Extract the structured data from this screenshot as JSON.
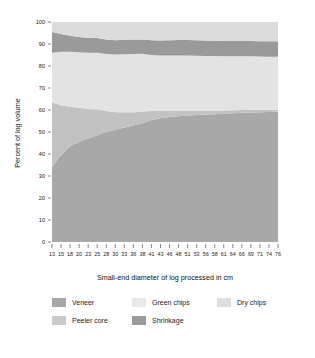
{
  "chart_data": {
    "type": "area",
    "stacked": true,
    "title": "",
    "xlabel": "Small-end diameter of log processed in cm",
    "ylabel": "Percent of log volume",
    "ylim": [
      0,
      100
    ],
    "yticks": [
      0,
      10,
      20,
      30,
      40,
      50,
      60,
      70,
      80,
      90,
      100
    ],
    "grid": false,
    "legend_position": "bottom",
    "categories": [
      13,
      15,
      18,
      20,
      23,
      25,
      28,
      30,
      33,
      36,
      38,
      41,
      43,
      46,
      48,
      51,
      53,
      56,
      58,
      61,
      64,
      66,
      69,
      71,
      74,
      76
    ],
    "series": [
      {
        "name": "Veneer",
        "color": "#a8a8a8",
        "values": [
          34.0,
          39.5,
          43.5,
          45.5,
          47.0,
          48.5,
          50.0,
          51.0,
          52.0,
          53.0,
          54.0,
          55.5,
          56.2,
          56.8,
          57.2,
          57.5,
          57.7,
          57.9,
          58.1,
          58.3,
          58.5,
          58.7,
          58.9,
          59.0,
          59.1,
          59.2
        ]
      },
      {
        "name": "Peeler core",
        "color": "#c2c2c2",
        "values": [
          29.5,
          22.5,
          18.0,
          15.5,
          13.5,
          11.8,
          9.5,
          8.0,
          7.0,
          6.0,
          5.3,
          4.0,
          3.3,
          2.8,
          2.5,
          2.3,
          2.1,
          1.9,
          1.7,
          1.5,
          1.4,
          1.3,
          1.2,
          1.1,
          1.0,
          1.0
        ]
      },
      {
        "name": "Green chips",
        "color": "#e3e3e3",
        "values": [
          22.5,
          24.5,
          25.0,
          25.2,
          25.5,
          25.7,
          26.0,
          26.2,
          26.3,
          26.5,
          26.3,
          25.5,
          25.3,
          25.2,
          25.1,
          25.0,
          24.9,
          24.8,
          24.7,
          24.6,
          24.5,
          24.4,
          24.3,
          24.2,
          24.1,
          24.0
        ]
      },
      {
        "name": "Shrinkage",
        "color": "#9a9a9a",
        "values": [
          9.5,
          8.0,
          7.3,
          7.0,
          6.8,
          6.7,
          6.6,
          6.5,
          6.6,
          6.5,
          6.4,
          6.7,
          6.8,
          6.9,
          7.0,
          7.0,
          7.0,
          7.0,
          7.0,
          7.0,
          7.0,
          7.0,
          7.0,
          7.0,
          7.0,
          7.0
        ]
      },
      {
        "name": "Dry chips",
        "color": "#dcdcdc",
        "values": [
          4.5,
          5.5,
          6.2,
          6.8,
          7.2,
          7.3,
          7.9,
          8.3,
          8.1,
          8.0,
          8.0,
          8.3,
          8.4,
          8.3,
          8.2,
          8.2,
          8.3,
          8.4,
          8.5,
          8.6,
          8.6,
          8.6,
          8.6,
          8.7,
          8.8,
          8.8
        ]
      }
    ]
  },
  "axes": {
    "y_title": "Percent of log volume",
    "x_title": "Small-end diameter of log processed in cm",
    "y_tick_labels": [
      "100",
      "90",
      "80",
      "70",
      "60",
      "50",
      "40",
      "30",
      "20",
      "10",
      "0"
    ],
    "x_tick_labels": [
      "13",
      "15",
      "18",
      "20",
      "23",
      "25",
      "28",
      "30",
      "33",
      "36",
      "38",
      "41",
      "43",
      "46",
      "48",
      "51",
      "53",
      "56",
      "58",
      "61",
      "64",
      "66",
      "69",
      "71",
      "74",
      "76"
    ]
  },
  "legend": {
    "items": [
      {
        "label": "Veneer",
        "color": "#a8a8a8"
      },
      {
        "label": "Green chips",
        "color": "#e3e3e3"
      },
      {
        "label": "Dry chips",
        "color": "#dcdcdc"
      },
      {
        "label": "Peeler core",
        "color": "#c2c2c2"
      },
      {
        "label": "Shrinkage",
        "color": "#9a9a9a"
      }
    ]
  }
}
